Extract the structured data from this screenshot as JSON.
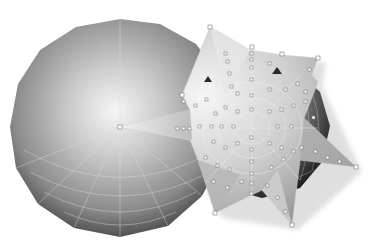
{
  "scene": {
    "description": "3D render of a faceted gray sphere with wireframe and a spiky star-shaped mesh with vertex handles",
    "background": "#ffffff",
    "colors": {
      "sphere_light": "#f4f4f4",
      "sphere_mid": "#a8a8a8",
      "sphere_dark": "#3a3a3a",
      "wire": "#d8d8d8",
      "star_light": "#f0f0f0",
      "star_mid": "#bdbdbd",
      "handle": "#ffffff",
      "handle_stroke": "#777777"
    },
    "left_sphere": {
      "cx": 120,
      "cy": 127,
      "r": 108
    },
    "right_sphere": {
      "cx": 262,
      "cy": 130,
      "r": 68
    },
    "star": {
      "center": [
        252,
        128
      ],
      "tips": [
        [
          120,
          127
        ],
        [
          210,
          27
        ],
        [
          318,
          58
        ],
        [
          318,
          82
        ],
        [
          356,
          167
        ],
        [
          292,
          225
        ],
        [
          215,
          213
        ],
        [
          182,
          95
        ]
      ]
    }
  }
}
